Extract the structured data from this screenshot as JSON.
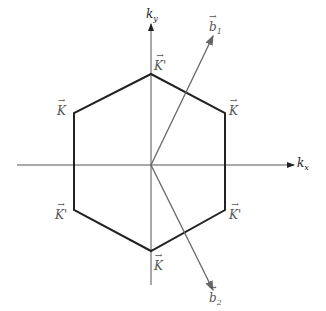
{
  "diagram": {
    "axes": {
      "x_label": "k",
      "x_sub": "x",
      "y_label": "k",
      "y_sub": "y"
    },
    "hexagon": {
      "vertices": [
        {
          "name": "top",
          "label": "K'",
          "x": 151,
          "y": 74
        },
        {
          "name": "upper-right",
          "label": "K",
          "x": 225,
          "y": 113
        },
        {
          "name": "lower-right",
          "label": "K'",
          "x": 225,
          "y": 210
        },
        {
          "name": "bottom",
          "label": "K",
          "x": 151,
          "y": 251
        },
        {
          "name": "lower-left",
          "label": "K'",
          "x": 74,
          "y": 210
        },
        {
          "name": "upper-left",
          "label": "K",
          "x": 74,
          "y": 113
        }
      ],
      "stroke_color": "#222222"
    },
    "vectors": [
      {
        "name": "b1",
        "label": "b",
        "sub": "1",
        "from": [
          151,
          165
        ],
        "to": [
          213,
          36
        ]
      },
      {
        "name": "b2",
        "label": "b",
        "sub": "2",
        "from": [
          151,
          165
        ],
        "to": [
          213,
          290
        ]
      }
    ],
    "vector_color": "#666666",
    "axis_color": "#555555"
  }
}
